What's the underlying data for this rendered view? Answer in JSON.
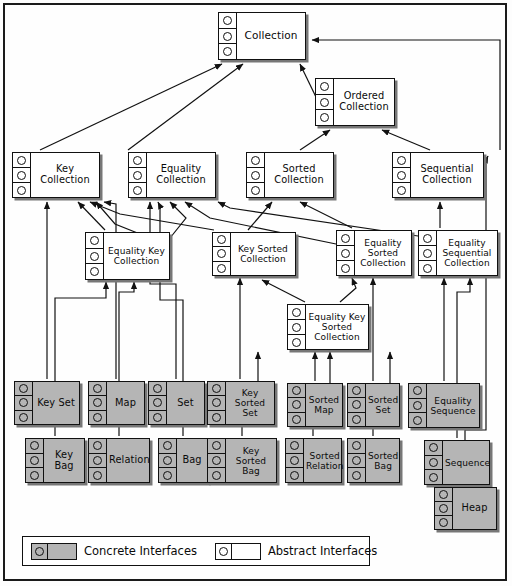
{
  "diagram": {
    "colors": {
      "concrete_fill": "#b5b5b5",
      "abstract_fill": "#ffffff",
      "border": "#111111",
      "shadow": "#777777",
      "background": "#fefefe"
    },
    "nodes": [
      {
        "id": "collection",
        "label": "Collection",
        "kind": "abstract",
        "lollipops": 3,
        "x": 218,
        "y": 12,
        "w": 88,
        "h": 48,
        "lines": 1
      },
      {
        "id": "ordered-collection",
        "label": "Ordered Collection",
        "kind": "abstract",
        "lollipops": 3,
        "x": 315,
        "y": 78,
        "w": 80,
        "h": 48,
        "lines": 2
      },
      {
        "id": "key-collection",
        "label": "Key Collection",
        "kind": "abstract",
        "lollipops": 3,
        "x": 12,
        "y": 152,
        "w": 88,
        "h": 46,
        "lines": 2
      },
      {
        "id": "equality-collection",
        "label": "Equality Collection",
        "kind": "abstract",
        "lollipops": 3,
        "x": 128,
        "y": 152,
        "w": 88,
        "h": 46,
        "lines": 2
      },
      {
        "id": "sorted-collection",
        "label": "Sorted Collection",
        "kind": "abstract",
        "lollipops": 3,
        "x": 246,
        "y": 152,
        "w": 88,
        "h": 46,
        "lines": 2
      },
      {
        "id": "sequential-collection",
        "label": "Sequential Collection",
        "kind": "abstract",
        "lollipops": 3,
        "x": 392,
        "y": 152,
        "w": 88,
        "h": 46,
        "lines": 2
      },
      {
        "id": "equality-key-collection",
        "label": "Equality Key Collection",
        "kind": "abstract",
        "lollipops": 3,
        "x": 85,
        "y": 232,
        "w": 85,
        "h": 48,
        "lines": 3
      },
      {
        "id": "key-sorted-collection",
        "label": "Key Sorted Collection",
        "kind": "abstract",
        "lollipops": 3,
        "x": 212,
        "y": 232,
        "w": 84,
        "h": 44,
        "lines": 2
      },
      {
        "id": "equality-sorted-collection",
        "label": "Equality Sorted Collection",
        "kind": "abstract",
        "lollipops": 3,
        "x": 336,
        "y": 230,
        "w": 76,
        "h": 46,
        "lines": 3
      },
      {
        "id": "equality-sequential-collection",
        "label": "Equality Sequential Collection",
        "kind": "abstract",
        "lollipops": 3,
        "x": 418,
        "y": 230,
        "w": 78,
        "h": 46,
        "lines": 3
      },
      {
        "id": "equality-key-sorted-collection",
        "label": "Equality Key Sorted Collection",
        "kind": "abstract",
        "lollipops": 3,
        "x": 287,
        "y": 304,
        "w": 80,
        "h": 46,
        "lines": 3
      },
      {
        "id": "key-set",
        "label": "Key Set",
        "kind": "concrete",
        "lollipops": 3,
        "x": 14,
        "y": 381,
        "w": 66,
        "h": 44,
        "lines": 1
      },
      {
        "id": "map",
        "label": "Map",
        "kind": "concrete",
        "lollipops": 3,
        "x": 88,
        "y": 381,
        "w": 57,
        "h": 44,
        "lines": 1
      },
      {
        "id": "set",
        "label": "Set",
        "kind": "concrete",
        "lollipops": 3,
        "x": 148,
        "y": 381,
        "w": 57,
        "h": 44,
        "lines": 1
      },
      {
        "id": "key-sorted-set",
        "label": "Key Sorted Set",
        "kind": "concrete",
        "lollipops": 3,
        "x": 207,
        "y": 381,
        "w": 66,
        "h": 44,
        "lines": 2
      },
      {
        "id": "sorted-map",
        "label": "Sorted Map",
        "kind": "concrete",
        "lollipops": 3,
        "x": 287,
        "y": 383,
        "w": 56,
        "h": 44,
        "lines": 2
      },
      {
        "id": "sorted-set",
        "label": "Sorted Set",
        "kind": "concrete",
        "lollipops": 3,
        "x": 347,
        "y": 383,
        "w": 53,
        "h": 44,
        "lines": 2
      },
      {
        "id": "equality-sequence",
        "label": "Equality Sequence",
        "kind": "concrete",
        "lollipops": 3,
        "x": 408,
        "y": 383,
        "w": 72,
        "h": 45,
        "lines": 2
      },
      {
        "id": "key-bag",
        "label": "Key Bag",
        "kind": "concrete",
        "lollipops": 3,
        "x": 25,
        "y": 438,
        "w": 60,
        "h": 45,
        "lines": 1
      },
      {
        "id": "relation",
        "label": "Relation",
        "kind": "concrete",
        "lollipops": 3,
        "x": 88,
        "y": 438,
        "w": 62,
        "h": 45,
        "lines": 1
      },
      {
        "id": "bag",
        "label": "Bag",
        "kind": "concrete",
        "lollipops": 3,
        "x": 158,
        "y": 438,
        "w": 50,
        "h": 45,
        "lines": 1
      },
      {
        "id": "key-sorted-bag",
        "label": "Key Sorted Bag",
        "kind": "concrete",
        "lollipops": 3,
        "x": 207,
        "y": 438,
        "w": 70,
        "h": 45,
        "lines": 2
      },
      {
        "id": "sorted-relation",
        "label": "Sorted Relation",
        "kind": "concrete",
        "lollipops": 3,
        "x": 285,
        "y": 438,
        "w": 57,
        "h": 45,
        "lines": 2
      },
      {
        "id": "sorted-bag",
        "label": "Sorted Bag",
        "kind": "concrete",
        "lollipops": 3,
        "x": 347,
        "y": 438,
        "w": 53,
        "h": 45,
        "lines": 2
      },
      {
        "id": "sequence",
        "label": "Sequence",
        "kind": "concrete",
        "lollipops": 3,
        "x": 424,
        "y": 440,
        "w": 66,
        "h": 45,
        "lines": 1
      },
      {
        "id": "heap",
        "label": "Heap",
        "kind": "concrete",
        "lollipops": 3,
        "x": 434,
        "y": 487,
        "w": 63,
        "h": 43,
        "lines": 1
      }
    ],
    "legend": {
      "concrete_label": "Concrete Interfaces",
      "abstract_label": "Abstract Interfaces"
    }
  }
}
